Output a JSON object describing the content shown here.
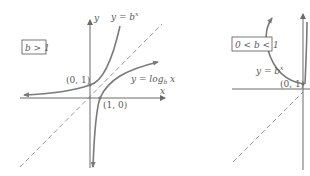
{
  "left_panel": {
    "condition_label": "b > 1",
    "y_axis_label": "y",
    "x_axis_label": "x",
    "exp_curve_label": "y = b",
    "exp_curve_superscript": "x",
    "log_curve_label": "y = log",
    "log_curve_subscript": "b",
    "log_curve_arg": " x",
    "point_exp": "(0, 1)",
    "point_log": "(1, 0)"
  },
  "right_panel": {
    "condition_label": "0 < b < 1",
    "exp_curve_label": "y = b",
    "exp_curve_superscript": "x",
    "point_exp": "(0, 1)"
  },
  "colors": {
    "curve": "#7a7a7a",
    "axis": "#6a6a6a",
    "dashed_line": "#9a9a9a",
    "text": "#5a5a5a"
  }
}
